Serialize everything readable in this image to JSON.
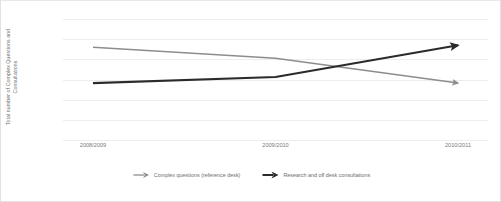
{
  "chart_data": {
    "type": "line",
    "title": "",
    "xlabel": "",
    "ylabel": "Total number of Complex Questions and Consultations",
    "ylabel_lines": [
      "Total number of Complex Questions and",
      "Consultations"
    ],
    "categories": [
      "2008/2009",
      "2009/2010",
      "2010/2011"
    ],
    "ylim": [
      0,
      1200
    ],
    "yticks": [
      1200,
      1000,
      800,
      600,
      400,
      200,
      0
    ],
    "ytick_labels": [
      "1200",
      "1000",
      "800",
      "600",
      "400",
      "200",
      "0"
    ],
    "grid": "horizontal",
    "legend_position": "bottom",
    "series": [
      {
        "name": "Complex questions (reference desk)",
        "values": [
          920,
          810,
          565
        ],
        "color": "#8d8d8d",
        "width": 1.6,
        "marker": "arrow-end"
      },
      {
        "name": "Research and off desk consultations",
        "values": [
          565,
          625,
          940
        ],
        "color": "#2b2b2b",
        "width": 2.2,
        "marker": "arrow-end"
      }
    ]
  },
  "legend": {
    "items": [
      {
        "label": "Complex questions (reference desk)",
        "color": "#8d8d8d",
        "icon": "arrow-right-icon"
      },
      {
        "label": "Research and off desk consultations",
        "color": "#2b2b2b",
        "icon": "arrow-right-icon"
      }
    ]
  }
}
